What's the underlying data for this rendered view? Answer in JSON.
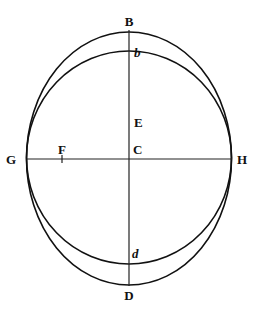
{
  "diagram": {
    "colors": {
      "stroke": "#111111",
      "background": "#ffffff"
    },
    "geometry": {
      "center": {
        "x": 129,
        "y": 159
      },
      "outer_ellipse": {
        "cx": 129,
        "cy": 158.5,
        "rx": 102.5,
        "ry": 126.5
      },
      "inner_ellipse": {
        "cx": 129,
        "cy": 157.5,
        "rx": 102.5,
        "ry": 106.5
      },
      "vertical_axis": {
        "x": 129,
        "y1": 32,
        "y2": 285
      },
      "horizontal_axis": {
        "y": 159,
        "x1": 27,
        "x2": 232
      },
      "f_tick": {
        "x": 62,
        "y": 159
      }
    },
    "labels": {
      "B": "B",
      "b": "b",
      "E": "E",
      "C": "C",
      "F": "F",
      "G": "G",
      "H": "H",
      "d": "d",
      "D": "D"
    }
  }
}
